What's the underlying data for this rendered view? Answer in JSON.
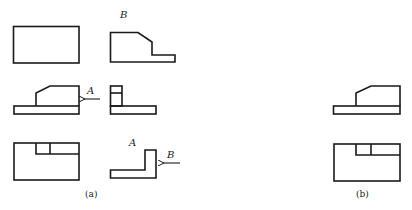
{
  "figure": {
    "panel_a": {
      "caption": "(a)",
      "views": [
        {
          "name": "top-view-rectangle"
        },
        {
          "name": "view-b",
          "label": "B"
        },
        {
          "name": "front-view"
        },
        {
          "name": "side-view",
          "arrow_label": "A"
        },
        {
          "name": "bottom-view"
        },
        {
          "name": "view-a",
          "label": "A",
          "arrow_label": "B"
        }
      ]
    },
    "panel_b": {
      "caption": "(b)",
      "views": [
        {
          "name": "front-view"
        },
        {
          "name": "bottom-view"
        }
      ]
    }
  }
}
